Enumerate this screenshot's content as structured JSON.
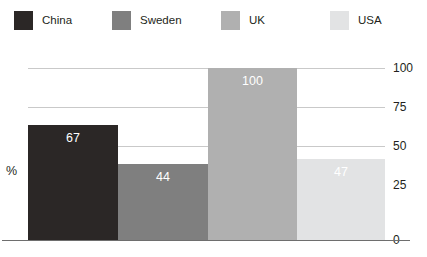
{
  "legend": {
    "position": "top",
    "entries": [
      {
        "label": "China",
        "color": "#2b2726",
        "swatch_name": "legend-swatch-china"
      },
      {
        "label": "Sweden",
        "color": "#7f7f7f",
        "swatch_name": "legend-swatch-sweden"
      },
      {
        "label": "UK",
        "color": "#b0b0b0",
        "swatch_name": "legend-swatch-uk"
      },
      {
        "label": "USA",
        "color": "#e2e3e4",
        "swatch_name": "legend-swatch-usa"
      }
    ]
  },
  "axis": {
    "y_title": "%",
    "ticks": [
      "100",
      "75",
      "50",
      "25",
      "0"
    ]
  },
  "chart_data": {
    "type": "bar",
    "title": "",
    "subtitle": "",
    "xlabel": "",
    "ylabel": "%",
    "ylim": [
      0,
      100
    ],
    "yticks": [
      0,
      25,
      50,
      75,
      100
    ],
    "grid": true,
    "legend_position": "top",
    "bar_gap": 0,
    "categories": [
      "China",
      "Sweden",
      "UK",
      "USA"
    ],
    "values": [
      67,
      44,
      100,
      47
    ],
    "data_labels": [
      "67",
      "44",
      "100",
      "47"
    ],
    "data_label_color": "#ffffff",
    "colors": [
      "#2b2726",
      "#7f7f7f",
      "#b0b0b0",
      "#e2e3e4"
    ],
    "series": [
      {
        "name": "%",
        "points": [
          {
            "category": "China",
            "value": 67,
            "label": "67",
            "color": "#2b2726"
          },
          {
            "category": "Sweden",
            "value": 44,
            "label": "44",
            "color": "#7f7f7f"
          },
          {
            "category": "UK",
            "value": 100,
            "label": "100",
            "color": "#b0b0b0"
          },
          {
            "category": "USA",
            "value": 47,
            "label": "47",
            "color": "#e2e3e4"
          }
        ]
      }
    ]
  }
}
